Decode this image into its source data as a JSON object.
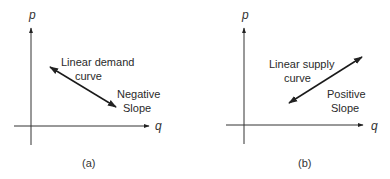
{
  "panels": [
    {
      "id": "a",
      "caption": "(a)",
      "y_axis_label": "p",
      "x_axis_label": "q",
      "curve_label_line1": "Linear demand",
      "curve_label_line2": "curve",
      "slope_label_line1": "Negative",
      "slope_label_line2": "Slope"
    },
    {
      "id": "b",
      "caption": "(b)",
      "y_axis_label": "p",
      "x_axis_label": "q",
      "curve_label_line1": "Linear supply",
      "curve_label_line2": "curve",
      "slope_label_line1": "Positive",
      "slope_label_line2": "Slope"
    }
  ],
  "colors": {
    "line": "#1a1a1a",
    "axis": "#333333",
    "text": "#2a2a2a"
  }
}
